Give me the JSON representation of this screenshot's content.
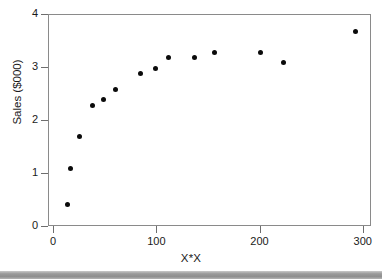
{
  "chart_data": {
    "type": "scatter",
    "title": "",
    "xlabel": "X*X",
    "ylabel": "Sales ($000)",
    "xlim": [
      -5,
      308
    ],
    "ylim": [
      0,
      4
    ],
    "xticks": [
      0,
      100,
      200,
      300
    ],
    "xtick_labels": [
      "0",
      "100",
      "200",
      "300"
    ],
    "yticks": [
      0,
      1,
      2,
      3,
      4
    ],
    "ytick_labels": [
      "0",
      "1",
      "2",
      "3",
      "4"
    ],
    "grid": false,
    "legend": false,
    "marker": "filled-circle",
    "marker_color": "#0b0b0b",
    "points": [
      {
        "x": 13,
        "y": 0.42
      },
      {
        "x": 16,
        "y": 1.1
      },
      {
        "x": 25,
        "y": 1.7
      },
      {
        "x": 37,
        "y": 2.3
      },
      {
        "x": 48,
        "y": 2.4
      },
      {
        "x": 59,
        "y": 2.6
      },
      {
        "x": 84,
        "y": 2.9
      },
      {
        "x": 98,
        "y": 3.0
      },
      {
        "x": 111,
        "y": 3.2
      },
      {
        "x": 136,
        "y": 3.2
      },
      {
        "x": 155,
        "y": 3.3
      },
      {
        "x": 200,
        "y": 3.3
      },
      {
        "x": 222,
        "y": 3.1
      },
      {
        "x": 292,
        "y": 3.68
      }
    ]
  },
  "axes": {
    "frame_color": "#8a8a8a",
    "tick_color": "#6e6e6e"
  },
  "footer": {
    "bar_color": "#9a9a9a"
  }
}
